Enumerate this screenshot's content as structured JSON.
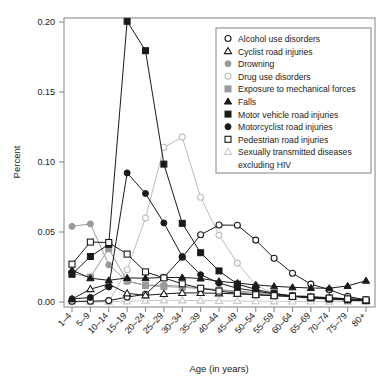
{
  "chart_data": {
    "type": "line",
    "title": "",
    "xlabel": "Age (in years)",
    "ylabel": "Percent",
    "ylim": [
      0.0,
      0.2
    ],
    "yticks": [
      0.0,
      0.05,
      0.1,
      0.15,
      0.2
    ],
    "ytick_labels": [
      "0.00",
      "0.05",
      "0.10",
      "0.15",
      "0.20"
    ],
    "grid": false,
    "legend_position": "top-right",
    "categories": [
      "1–4",
      "5–9",
      "10–14",
      "15–19",
      "20–24",
      "25–29",
      "30–34",
      "35–39",
      "40–44",
      "45–49",
      "50–54",
      "55–59",
      "60–64",
      "65–69",
      "70–74",
      "75–79",
      "80+"
    ],
    "series": [
      {
        "name": "Alcohol use disorders",
        "marker": "open-circle",
        "color": "#1a1a1a",
        "values": [
          0.0005,
          0.0005,
          0.001,
          0.0035,
          0.0055,
          0.0175,
          0.032,
          0.048,
          0.055,
          0.0548,
          0.0442,
          0.0312,
          0.0205,
          0.0128,
          0.0088,
          0.004,
          0.0015
        ]
      },
      {
        "name": "Cyclist road injuries",
        "marker": "open-triangle",
        "color": "#1a1a1a",
        "values": [
          0.002,
          0.0092,
          0.0128,
          0.0062,
          0.0048,
          0.0058,
          0.0065,
          0.0065,
          0.0062,
          0.0058,
          0.0052,
          0.0045,
          0.004,
          0.0035,
          0.003,
          0.0022,
          0.0012
        ]
      },
      {
        "name": "Drowning",
        "marker": "filled-circle-gray",
        "color": "#9a9a9a",
        "values": [
          0.054,
          0.0558,
          0.0265,
          0.0148,
          0.012,
          0.012,
          0.0112,
          0.01,
          0.0088,
          0.0078,
          0.0068,
          0.0058,
          0.0048,
          0.004,
          0.0032,
          0.0025,
          0.0018
        ]
      },
      {
        "name": "Drug use disorders",
        "marker": "open-circle-gray",
        "color": "#bdbdbd",
        "values": [
          0.0002,
          0.0002,
          0.0002,
          0.023,
          0.06,
          0.1105,
          0.1178,
          0.0748,
          0.0478,
          0.0278,
          0.012,
          0.0062,
          0.0038,
          0.0025,
          0.0018,
          0.0012,
          0.0008
        ]
      },
      {
        "name": "Exposure to mechanical forces",
        "marker": "filled-square-gray",
        "color": "#9a9a9a",
        "values": [
          0.0205,
          0.0178,
          0.038,
          0.015,
          0.0118,
          0.011,
          0.0105,
          0.0095,
          0.0085,
          0.0072,
          0.0062,
          0.0052,
          0.0045,
          0.0038,
          0.003,
          0.0022,
          0.0015
        ]
      },
      {
        "name": "Falls",
        "marker": "filled-triangle",
        "color": "#1a1a1a",
        "values": [
          0.0228,
          0.017,
          0.0155,
          0.0172,
          0.017,
          0.0175,
          0.0175,
          0.0168,
          0.0148,
          0.0135,
          0.0122,
          0.0112,
          0.0105,
          0.01,
          0.0098,
          0.0115,
          0.0152
        ]
      },
      {
        "name": "Motor vehicle road injuries",
        "marker": "filled-square",
        "color": "#1a1a1a",
        "values": [
          0.0198,
          0.0325,
          0.0412,
          0.2005,
          0.1795,
          0.0985,
          0.0562,
          0.0352,
          0.0222,
          0.0128,
          0.009,
          0.0062,
          0.0042,
          0.003,
          0.0022,
          0.0015,
          0.001
        ]
      },
      {
        "name": "Motorcyclist road injuries",
        "marker": "filled-circle",
        "color": "#1a1a1a",
        "values": [
          0.0022,
          0.0032,
          0.0108,
          0.0922,
          0.0775,
          0.0565,
          0.0325,
          0.0195,
          0.0135,
          0.0098,
          0.0078,
          0.0058,
          0.0042,
          0.003,
          0.0022,
          0.0015,
          0.001
        ]
      },
      {
        "name": "Pedestrian road injuries",
        "marker": "open-square",
        "color": "#1a1a1a",
        "values": [
          0.027,
          0.0428,
          0.0425,
          0.0342,
          0.0215,
          0.0172,
          0.013,
          0.0098,
          0.0078,
          0.0062,
          0.0052,
          0.0045,
          0.004,
          0.0035,
          0.0028,
          0.0022,
          0.0015
        ]
      },
      {
        "name": "Sexually transmitted diseases excluding HIV",
        "marker": "open-triangle-gray",
        "color": "#c9c9c9",
        "values": [
          0.0002,
          0.0002,
          0.0002,
          0.0005,
          0.001,
          0.0012,
          0.0012,
          0.001,
          0.0008,
          0.0007,
          0.0006,
          0.0005,
          0.0004,
          0.0004,
          0.0003,
          0.0003,
          0.0002
        ]
      }
    ]
  },
  "axes": {
    "y_title": "Percent",
    "x_title": "Age (in years)"
  },
  "legend": {
    "entries": [
      {
        "label": "Alcohol use disorders",
        "marker": "open-circle",
        "color": "#1a1a1a"
      },
      {
        "label": "Cyclist road injuries",
        "marker": "open-triangle",
        "color": "#1a1a1a"
      },
      {
        "label": "Drowning",
        "marker": "filled-circle-gray",
        "color": "#9a9a9a"
      },
      {
        "label": "Drug use disorders",
        "marker": "open-circle-gray",
        "color": "#bdbdbd"
      },
      {
        "label": "Exposure to mechanical forces",
        "marker": "filled-square-gray",
        "color": "#9a9a9a"
      },
      {
        "label": "Falls",
        "marker": "filled-triangle",
        "color": "#1a1a1a"
      },
      {
        "label": "Motor vehicle road injuries",
        "marker": "filled-square",
        "color": "#1a1a1a"
      },
      {
        "label": "Motorcyclist road injuries",
        "marker": "filled-circle",
        "color": "#1a1a1a"
      },
      {
        "label": "Pedestrian road injuries",
        "marker": "open-square",
        "color": "#1a1a1a"
      },
      {
        "label": "Sexually transmitted diseases",
        "marker": "open-triangle-gray",
        "color": "#c9c9c9"
      },
      {
        "label": "excluding HIV",
        "marker": "none",
        "color": "#1a1a1a"
      }
    ]
  }
}
